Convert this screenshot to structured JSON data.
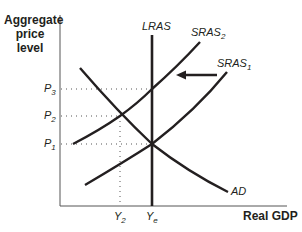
{
  "diagram": {
    "type": "AD-AS model",
    "y_axis_label": "Aggregate price level",
    "y_axis_label_lines": [
      "Aggregate",
      "price",
      "level"
    ],
    "x_axis_label": "Real GDP",
    "curves": {
      "lras": {
        "label": "LRAS"
      },
      "sras1": {
        "base": "SRAS",
        "sub": "1"
      },
      "sras2": {
        "base": "SRAS",
        "sub": "2"
      },
      "ad": {
        "label": "AD"
      }
    },
    "price_levels": [
      {
        "base": "P",
        "sub": "3"
      },
      {
        "base": "P",
        "sub": "2"
      },
      {
        "base": "P",
        "sub": "1"
      }
    ],
    "output_levels": [
      {
        "base": "Y",
        "sub": "2"
      },
      {
        "base": "Y",
        "sub": "e"
      }
    ],
    "shift_arrow": {
      "direction": "left",
      "from": "SRAS1",
      "to": "SRAS2"
    },
    "colors": {
      "ink": "#231f20",
      "background": "#ffffff"
    }
  }
}
